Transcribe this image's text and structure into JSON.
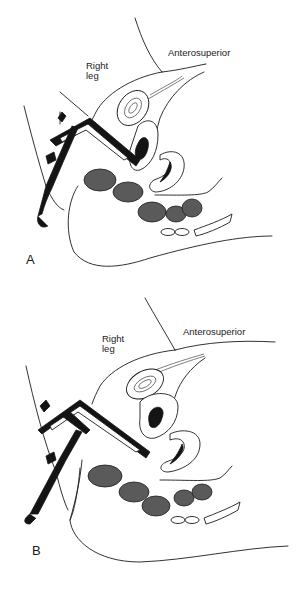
{
  "figure": {
    "panels": [
      {
        "letter": "A",
        "labels": {
          "leg": "Right\nleg",
          "leg_line1": "Right",
          "leg_line2": "leg",
          "direction": "Anterosuperior"
        }
      },
      {
        "letter": "B",
        "labels": {
          "leg_line1": "Right",
          "leg_line2": "leg",
          "direction": "Anterosuperior"
        }
      }
    ],
    "caption_partial": ""
  }
}
